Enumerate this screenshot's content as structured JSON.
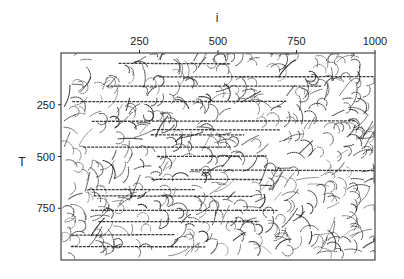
{
  "chart_data": {
    "type": "heatmap",
    "title": "",
    "xlabel": "i",
    "ylabel": "T",
    "x_axis_position": "top",
    "xlim": [
      0,
      1000
    ],
    "ylim": [
      0,
      1000
    ],
    "y_inverted": true,
    "x_ticks": [
      250,
      500,
      750,
      1000
    ],
    "y_ticks": [
      250,
      500,
      750
    ],
    "x_tick_labels": [
      "250",
      "500",
      "750",
      "1000"
    ],
    "y_tick_labels": [
      "250",
      "500",
      "750"
    ],
    "horizontal_streaks_T": [
      50,
      115,
      160,
      235,
      330,
      370,
      395,
      455,
      500,
      565,
      610,
      660,
      690,
      760,
      815,
      880,
      935
    ],
    "grid": false,
    "legend": "none",
    "colors": {
      "ink": "#1a1a1a",
      "background": "#ffffff"
    }
  }
}
